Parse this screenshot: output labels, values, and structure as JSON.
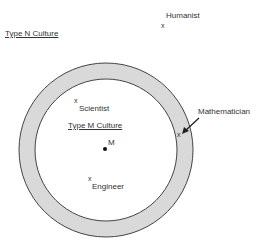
{
  "diagram": {
    "outer_label": "Type N Culture",
    "inner_label": "Type M Culture",
    "center_label": "M",
    "points": [
      {
        "name": "Humanist",
        "marker": "x"
      },
      {
        "name": "Scientist",
        "marker": "x"
      },
      {
        "name": "Engineer",
        "marker": "x"
      },
      {
        "name": "Mathematician",
        "marker": "x"
      }
    ],
    "colors": {
      "ring": "#d9d9d9",
      "stroke": "#444444"
    }
  }
}
